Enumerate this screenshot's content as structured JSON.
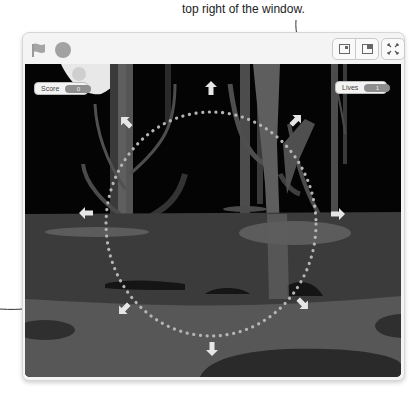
{
  "annotation": {
    "caption_text": "top right of the window."
  },
  "toolbar": {
    "green_flag_icon": "flag-icon",
    "stop_icon": "stop-icon",
    "small_stage_icon": "small-stage-icon",
    "large_stage_icon": "large-stage-icon",
    "fullscreen_icon": "fullscreen-icon"
  },
  "stage": {
    "monitors": {
      "score": {
        "label": "Score",
        "value": "0"
      },
      "lives": {
        "label": "Lives",
        "value": "1"
      }
    },
    "direction_arrows": [
      "up",
      "up-right",
      "right",
      "down-right",
      "down",
      "down-left",
      "left",
      "up-left"
    ],
    "colors": {
      "sky": "#040404",
      "tree_light": "#5e5e5e",
      "tree_dark": "#3a3a3a",
      "ground_far": "#3b3b3b",
      "ground_mid": "#4a4a4a",
      "ground_near": "#5c5c5c",
      "puddle": "#6e6e6e",
      "shadow": "#2a2a2a",
      "dots": "#b5b5b5",
      "arrows": "#e6e6e6"
    }
  }
}
